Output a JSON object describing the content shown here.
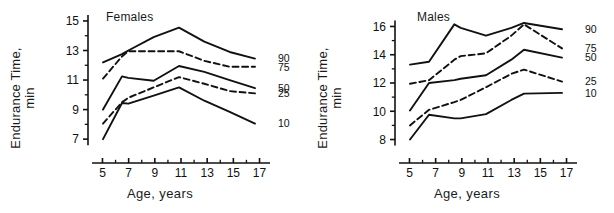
{
  "figure": {
    "axis_titles": {
      "y_line1": "Endurance Time,",
      "y_line2": "min",
      "x": "Age, years"
    },
    "line_styles": {
      "solid": "solid",
      "dashed": "dashed"
    },
    "colors": {
      "ink": "#111111",
      "background": "#ffffff"
    }
  },
  "chart_data": [
    {
      "type": "line",
      "title": "Females",
      "xlabel": "Age, years",
      "ylabel": "Endurance Time, min",
      "x": [
        5,
        6.5,
        7,
        9,
        11,
        13,
        15,
        17
      ],
      "xlim": [
        4.2,
        17.8
      ],
      "ylim": [
        6.4,
        15.2
      ],
      "xticks": [
        5,
        7,
        9,
        11,
        13,
        15,
        17
      ],
      "xminorticks": [
        6,
        8,
        10,
        12,
        14,
        16
      ],
      "yticks": [
        7,
        9,
        11,
        13,
        15
      ],
      "yminorticks": [
        8,
        10,
        12,
        14
      ],
      "grid": false,
      "legend_position": "right-of-axes",
      "series": [
        {
          "name": "90",
          "label": "90",
          "style": "solid",
          "values": [
            12.2,
            12.75,
            13.0,
            13.9,
            14.55,
            13.6,
            12.9,
            12.45
          ]
        },
        {
          "name": "75",
          "label": "75",
          "style": "dashed",
          "values": [
            11.1,
            12.6,
            12.95,
            12.95,
            12.95,
            12.3,
            11.9,
            11.9
          ]
        },
        {
          "name": "50",
          "label": "50",
          "style": "solid",
          "values": [
            9.0,
            11.25,
            11.15,
            10.95,
            11.95,
            11.55,
            11.0,
            10.45
          ]
        },
        {
          "name": "25",
          "label": "25",
          "style": "dashed",
          "values": [
            8.05,
            9.5,
            9.8,
            10.5,
            11.2,
            10.75,
            10.25,
            10.1
          ]
        },
        {
          "name": "10",
          "label": "10",
          "style": "solid",
          "values": [
            7.0,
            9.45,
            9.4,
            9.95,
            10.5,
            9.6,
            8.85,
            8.05
          ]
        }
      ]
    },
    {
      "type": "line",
      "title": "Males",
      "xlabel": "Age, years",
      "ylabel": "Endurance Time, min",
      "x": [
        5,
        6.5,
        8.5,
        9,
        11,
        13,
        14,
        17
      ],
      "xlim": [
        4.2,
        17.8
      ],
      "ylim": [
        7.4,
        16.6
      ],
      "xticks": [
        5,
        7,
        9,
        11,
        13,
        15,
        17
      ],
      "xminorticks": [
        6,
        8,
        10,
        12,
        14,
        16
      ],
      "yticks": [
        8,
        10,
        12,
        14,
        16
      ],
      "yminorticks": [
        9,
        11,
        13,
        15
      ],
      "grid": false,
      "legend_position": "right-of-axes",
      "series": [
        {
          "name": "90",
          "label": "90",
          "style": "solid",
          "values": [
            13.3,
            13.5,
            16.15,
            15.9,
            15.35,
            15.9,
            16.25,
            15.8
          ]
        },
        {
          "name": "75",
          "label": "75",
          "style": "dashed",
          "values": [
            11.95,
            12.2,
            13.65,
            13.9,
            14.1,
            15.35,
            16.15,
            14.45
          ]
        },
        {
          "name": "50",
          "label": "50",
          "style": "solid",
          "values": [
            10.05,
            12.0,
            12.2,
            12.3,
            12.55,
            13.65,
            14.35,
            13.8
          ]
        },
        {
          "name": "25",
          "label": "25",
          "style": "dashed",
          "values": [
            9.0,
            10.1,
            10.65,
            10.8,
            11.7,
            12.65,
            12.95,
            12.1
          ]
        },
        {
          "name": "10",
          "label": "10",
          "style": "solid",
          "values": [
            8.0,
            9.75,
            9.5,
            9.5,
            9.8,
            10.8,
            11.25,
            11.3
          ]
        }
      ]
    }
  ]
}
